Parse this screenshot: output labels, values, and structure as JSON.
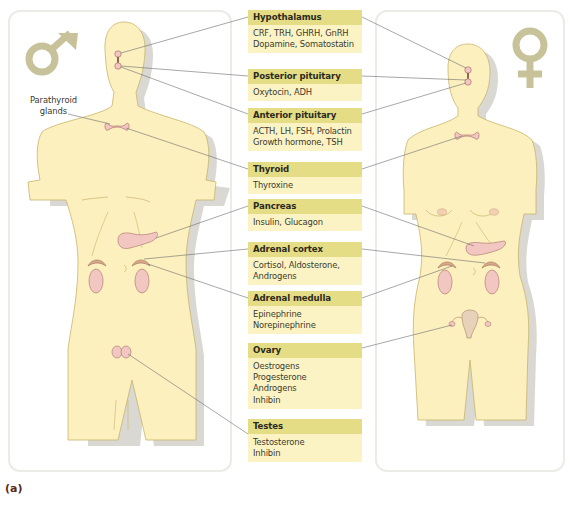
{
  "figure": {
    "tag": "(a)",
    "side_label": {
      "line1": "Parathyroid",
      "line2": "glands"
    },
    "symbols": {
      "male": "male-symbol",
      "female": "female-symbol"
    },
    "colors": {
      "body_fill": "#FBF0BE",
      "body_outline": "#c9b56a",
      "shadow": "#d9d8d2",
      "label_header": "#E4DD86",
      "label_body": "#FBF3C4",
      "gland": "#F2C7C2",
      "gland_outline": "#b57d74",
      "symbol": "#c8c29a",
      "leader_line": "#6d6d6d"
    },
    "labels": [
      {
        "title": "Hypothalamus",
        "lines": [
          "CRF, TRH, GHRH, GnRH",
          "Dopamine, Somatostatin"
        ]
      },
      {
        "title": "Posterior pituitary",
        "lines": [
          "Oxytocin, ADH"
        ]
      },
      {
        "title": "Anterior pituitary",
        "lines": [
          "ACTH, LH, FSH, Prolactin",
          "Growth hormone, TSH"
        ]
      },
      {
        "title": "Thyroid",
        "lines": [
          "Thyroxine"
        ]
      },
      {
        "title": "Pancreas",
        "lines": [
          "Insulin, Glucagon"
        ]
      },
      {
        "title": "Adrenal cortex",
        "lines": [
          "Cortisol, Aldosterone,",
          "Androgens"
        ]
      },
      {
        "title": "Adrenal medulla",
        "lines": [
          "Epinephrine",
          "Norepinephrine"
        ]
      },
      {
        "title": "Ovary",
        "lines": [
          "Oestrogens",
          "Progesterone",
          "Androgens",
          "Inhibin"
        ]
      },
      {
        "title": "Testes",
        "lines": [
          "Testosterone",
          "Inhibin"
        ]
      }
    ]
  }
}
